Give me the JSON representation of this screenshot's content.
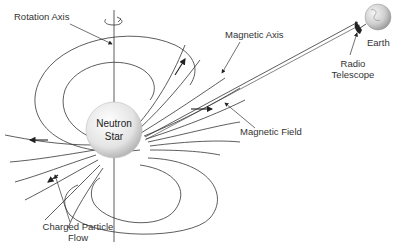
{
  "diagram": {
    "labels": {
      "rotation_axis": "Rotation Axis",
      "magnetic_axis": "Magnetic Axis",
      "earth": "Earth",
      "radio_telescope_line1": "Radio",
      "radio_telescope_line2": "Telescope",
      "magnetic_field": "Magnetic Field",
      "neutron_star_line1": "Neutron",
      "neutron_star_line2": "Star",
      "charged_particle_line1": "Charged Particle",
      "charged_particle_line2": "Flow"
    },
    "colors": {
      "line": "#333333",
      "star_fill": "#e6e6e6",
      "star_edge": "#bdbdbd",
      "earth_fill": "#d8d8d8",
      "text": "#333333"
    },
    "icons": [
      "rotation-arrow-icon",
      "neutron-star-sphere",
      "earth-globe-icon",
      "radio-telescope-icon",
      "flow-arrow-icon"
    ]
  }
}
